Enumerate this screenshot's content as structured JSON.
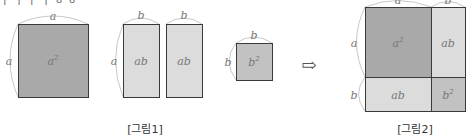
{
  "header": {
    "cropped_text": "ㅏ ㅓ ㅏ ㅓ ㅎ ㅎ"
  },
  "colors": {
    "a_squared_fill": "#a9a9a9",
    "ab_fill": "#dcdcdc",
    "b_squared_fill": "#c2c2c2",
    "border": "#3a3a3a",
    "arc": "#c8c8c8"
  },
  "figure1": {
    "caption": "[그림1]",
    "shapes": [
      {
        "id": "a2",
        "label": "a",
        "exp": "2",
        "width_label": "a",
        "height_label": "a"
      },
      {
        "id": "ab1",
        "label": "ab",
        "width_label": "b",
        "height_label": "a"
      },
      {
        "id": "ab2",
        "label": "ab",
        "width_label": "b"
      },
      {
        "id": "b2",
        "label": "b",
        "exp": "2",
        "width_label": "b",
        "height_label": "b"
      }
    ]
  },
  "arrow": {
    "glyph": "⇨"
  },
  "figure2": {
    "caption": "[그림2]",
    "top_labels": [
      "a",
      "b"
    ],
    "side_labels": [
      "a",
      "b"
    ],
    "cells": [
      {
        "label": "a",
        "exp": "2"
      },
      {
        "label": "ab"
      },
      {
        "label": "ab"
      },
      {
        "label": "b",
        "exp": "2"
      }
    ]
  }
}
